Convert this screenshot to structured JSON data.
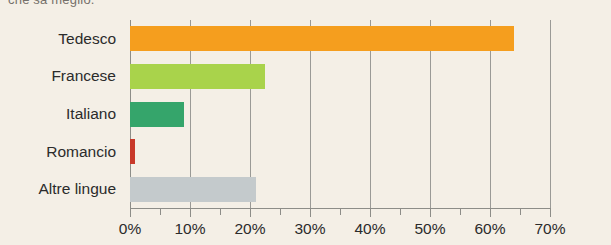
{
  "top_caption": "che sa meglio.",
  "chart_data": {
    "type": "bar",
    "orientation": "horizontal",
    "title": "",
    "subtitle": "",
    "xlabel": "",
    "ylabel": "",
    "categories": [
      "Tedesco",
      "Francese",
      "Italiano",
      "Romancio",
      "Altre lingue"
    ],
    "values": [
      64.0,
      22.5,
      9.0,
      0.8,
      21.0
    ],
    "value_suffix": "%",
    "colors": [
      "#F59E1E",
      "#A9D34B",
      "#35A56B",
      "#C8392A",
      "#C4CACC"
    ],
    "xlim": [
      0,
      70
    ],
    "xticks": [
      0,
      10,
      20,
      30,
      40,
      50,
      60,
      70
    ],
    "xtick_labels": [
      "0%",
      "10%",
      "20%",
      "30%",
      "40%",
      "50%",
      "60%",
      "70%"
    ],
    "minor_tick_step": 5,
    "grid": "vertical-major",
    "legend": "none",
    "background_color": "#F4EFE6",
    "axis_color": "#8D8D88",
    "gridline_color": "#9A9A96"
  }
}
